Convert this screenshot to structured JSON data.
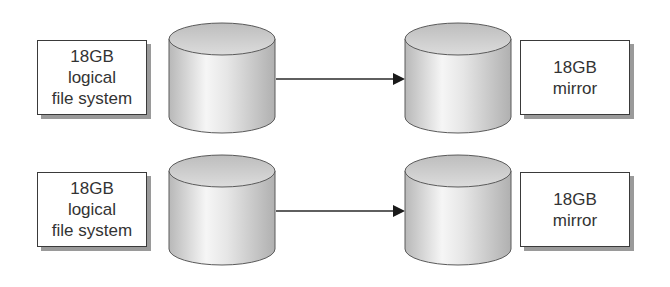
{
  "diagram": {
    "rows": [
      {
        "source": {
          "lines": [
            "18GB",
            "logical",
            "file system"
          ]
        },
        "target": {
          "lines": [
            "18GB",
            "mirror"
          ]
        }
      },
      {
        "source": {
          "lines": [
            "18GB",
            "logical",
            "file system"
          ]
        },
        "target": {
          "lines": [
            "18GB",
            "mirror"
          ]
        }
      }
    ],
    "icons": {
      "source_disk": "disk-cylinder-icon",
      "target_disk": "disk-cylinder-icon",
      "connector": "arrow-right-icon"
    },
    "colors": {
      "stroke": "#3a3a3a",
      "shadow": "#9a9a9a",
      "cylinder_light": "#f4f4f4",
      "cylinder_dark": "#b5b5b5",
      "text": "#333333"
    }
  }
}
